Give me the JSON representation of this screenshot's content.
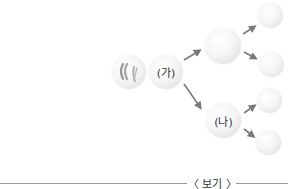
{
  "diagram": {
    "type": "cell-division-tree",
    "nodes": [
      {
        "id": "origin",
        "label": "",
        "description": "cell with chromosomes"
      },
      {
        "id": "ga",
        "label": "(가)"
      },
      {
        "id": "mid_top",
        "label": ""
      },
      {
        "id": "na",
        "label": "(나)"
      },
      {
        "id": "top_right_1",
        "label": ""
      },
      {
        "id": "top_right_2",
        "label": ""
      },
      {
        "id": "bottom_right_1",
        "label": ""
      },
      {
        "id": "bottom_right_2",
        "label": ""
      }
    ],
    "edges": [
      [
        "origin",
        "ga"
      ],
      [
        "ga",
        "mid_top"
      ],
      [
        "ga",
        "na"
      ],
      [
        "mid_top",
        "top_right_1"
      ],
      [
        "mid_top",
        "top_right_2"
      ],
      [
        "na",
        "bottom_right_1"
      ],
      [
        "na",
        "bottom_right_2"
      ]
    ],
    "labels": {
      "ga": "(가)",
      "na": "(나)",
      "plus": "+"
    },
    "section_title": "〈 보기 〉"
  },
  "colors": {
    "arrow": "#7a7a7a",
    "divider": "#9a9a9a",
    "text": "#333333"
  }
}
